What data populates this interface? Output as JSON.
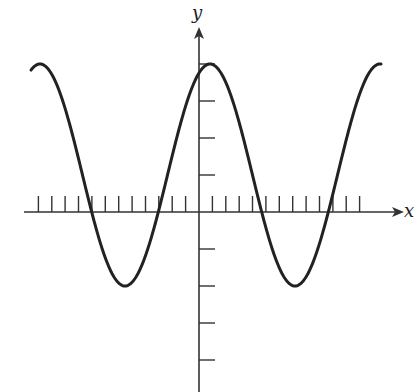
{
  "labels": {
    "x_axis": "x",
    "y_axis": "y"
  },
  "colors": {
    "curve": "#222222",
    "axis": "#333333",
    "background": "#ffffff"
  },
  "chart_data": {
    "type": "line",
    "title": "",
    "xlabel": "x",
    "ylabel": "y",
    "function": "y = 1 + 3cos(x)",
    "x_ticks_per_period": 12.7,
    "y_tick_values": [
      -4,
      -3,
      -2,
      -1,
      1,
      2,
      3,
      4
    ],
    "ylim": [
      -4.8,
      5
    ],
    "max": 4,
    "min": -2,
    "midline": 1,
    "amplitude": 3,
    "grid": false,
    "legend": null,
    "x": [
      -2.02,
      -1.5,
      -1.0,
      -0.5,
      0,
      0.5,
      1.0,
      1.5,
      2.0
    ],
    "x_units": "periods (peak at 0)",
    "values": [
      3.98,
      -2.0,
      4.0,
      -2.0,
      4.0,
      -2.0,
      4.0,
      -2.0,
      4.0
    ]
  }
}
